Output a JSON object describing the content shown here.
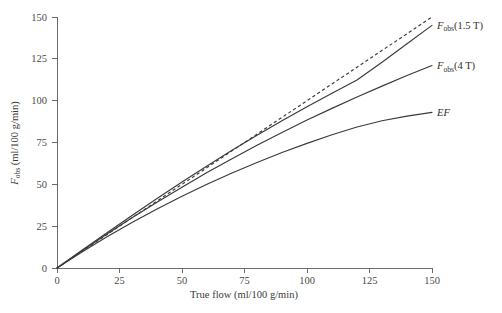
{
  "chart_data": {
    "type": "line",
    "title": "",
    "xlabel": "True flow (ml/100 g/min)",
    "ylabel": "F_obs (ml/100 g/min)",
    "ylabel_parts": {
      "symbol": "F",
      "subscript": "obs",
      "units": " (ml/100 g/min)"
    },
    "xlim": [
      0,
      150
    ],
    "ylim": [
      0,
      150
    ],
    "xticks": [
      0,
      25,
      50,
      75,
      100,
      125,
      150
    ],
    "yticks": [
      0,
      25,
      50,
      75,
      100,
      125,
      150
    ],
    "xtick_labels": [
      "0",
      "25",
      "50",
      "75",
      "100",
      "125",
      "150"
    ],
    "ytick_labels": [
      "0",
      "25",
      "50",
      "75",
      "100",
      "125",
      "150"
    ],
    "grid": false,
    "legend_position": "right-of-curve-ends",
    "line_color": "#3a3a3a",
    "axis_color": "#6b6b6b",
    "x": [
      0,
      10,
      20,
      30,
      40,
      50,
      60,
      70,
      80,
      90,
      100,
      110,
      120,
      130,
      140,
      150
    ],
    "series": [
      {
        "name": "identity",
        "label": "",
        "style": "dashed",
        "label_parts": null,
        "values": [
          0,
          10,
          20,
          30,
          40,
          50,
          60,
          70,
          80,
          90,
          100,
          110,
          120,
          130,
          140,
          150
        ]
      },
      {
        "name": "F_obs(1.5 T)",
        "label": "Fobs(1.5 T)",
        "style": "solid",
        "label_parts": {
          "symbol": "F",
          "subscript": "obs",
          "suffix": "(1.5 T)"
        },
        "values": [
          0,
          10.6,
          21.1,
          31.4,
          41.5,
          51.4,
          61.0,
          70.3,
          79.3,
          88.0,
          96.4,
          104.5,
          112.3,
          123.0,
          134.0,
          145.0
        ]
      },
      {
        "name": "F_obs(4 T)",
        "label": "Fobs(4 T)",
        "style": "solid",
        "label_parts": {
          "symbol": "F",
          "subscript": "obs",
          "suffix": "(4 T)"
        },
        "values": [
          0,
          10.3,
          20.3,
          30.0,
          39.3,
          48.3,
          57.0,
          65.3,
          73.3,
          81.0,
          88.4,
          95.4,
          102.2,
          108.7,
          115.0,
          121.0
        ]
      },
      {
        "name": "EF",
        "label": "EF",
        "style": "solid",
        "label_parts": {
          "symbol": "EF",
          "subscript": "",
          "suffix": ""
        },
        "values": [
          0,
          9.6,
          18.7,
          27.2,
          35.3,
          42.9,
          50.1,
          56.8,
          63.1,
          69.0,
          74.5,
          79.6,
          84.3,
          88.0,
          90.8,
          93.0
        ]
      }
    ],
    "series_labels": [
      {
        "text": "Fobs(1.5 T)",
        "x": 150,
        "y": 145
      },
      {
        "text": "Fobs(4 T)",
        "x": 150,
        "y": 121
      },
      {
        "text": "EF",
        "x": 150,
        "y": 93
      }
    ]
  }
}
